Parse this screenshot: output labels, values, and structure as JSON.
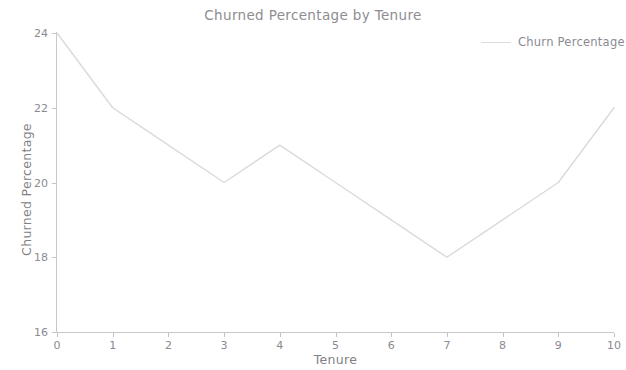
{
  "chart_data": {
    "type": "line",
    "title": "Churned Percentage by Tenure",
    "xlabel": "Tenure",
    "ylabel": "Churned Percentage",
    "x": [
      0,
      1,
      2,
      3,
      4,
      5,
      6,
      7,
      8,
      9,
      10
    ],
    "values": [
      24,
      22,
      21,
      20,
      21,
      20,
      19,
      18,
      19,
      20,
      22
    ],
    "series": [
      {
        "name": "Churn Percentage",
        "values": [
          24,
          22,
          21,
          20,
          21,
          20,
          19,
          18,
          19,
          20,
          22
        ]
      }
    ],
    "xtick_labels": [
      "0",
      "1",
      "2",
      "3",
      "4",
      "5",
      "6",
      "7",
      "8",
      "9",
      "10"
    ],
    "ytick_labels": [
      "16",
      "18",
      "20",
      "22",
      "24"
    ],
    "yticks": [
      16,
      18,
      20,
      22,
      24
    ],
    "xlim": [
      0,
      10
    ],
    "ylim": [
      16,
      24
    ],
    "grid": false,
    "legend": {
      "position": "upper right",
      "entries": [
        "Churn Percentage"
      ]
    },
    "colors": {
      "line": "#d8d8dc",
      "text": "#8a8a90",
      "axis": "#c9c9cd",
      "background": "#ffffff"
    }
  }
}
